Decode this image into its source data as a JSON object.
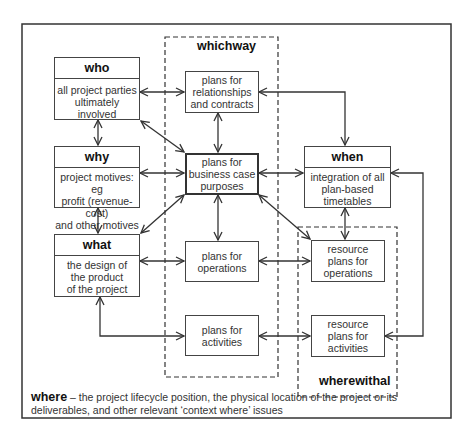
{
  "diagram": {
    "who": {
      "title": "who",
      "text_lines": [
        "all project parties",
        "ultimately involved"
      ]
    },
    "why": {
      "title": "why",
      "text_lines": [
        "project motives: eg",
        "profit (revenue-cost)",
        "and other motives"
      ]
    },
    "what": {
      "title": "what",
      "text_lines": [
        "the design of",
        "the product",
        "of the project"
      ]
    },
    "when": {
      "title": "when",
      "text_lines": [
        "integration of all",
        "plan-based",
        "timetables"
      ]
    },
    "whichway": {
      "label": "whichway",
      "plans": [
        {
          "id": "relationships",
          "text_lines": [
            "plans for",
            "relationships",
            "and contracts"
          ]
        },
        {
          "id": "business-case",
          "text_lines": [
            "plans for",
            "business case",
            "purposes"
          ]
        },
        {
          "id": "operations",
          "text_lines": [
            "plans for",
            "operations"
          ]
        },
        {
          "id": "activities",
          "text_lines": [
            "plans for",
            "activities"
          ]
        }
      ]
    },
    "wherewithal": {
      "label": "wherewithal",
      "plans": [
        {
          "id": "resource-operations",
          "text_lines": [
            "resource",
            "plans for",
            "operations"
          ]
        },
        {
          "id": "resource-activities",
          "text_lines": [
            "resource",
            "plans for",
            "activities"
          ]
        }
      ]
    },
    "where": {
      "label": "where",
      "text": " – the project lifecycle position, the physical location of the project or its deliverables, and other relevant ‘context where’ issues"
    }
  }
}
